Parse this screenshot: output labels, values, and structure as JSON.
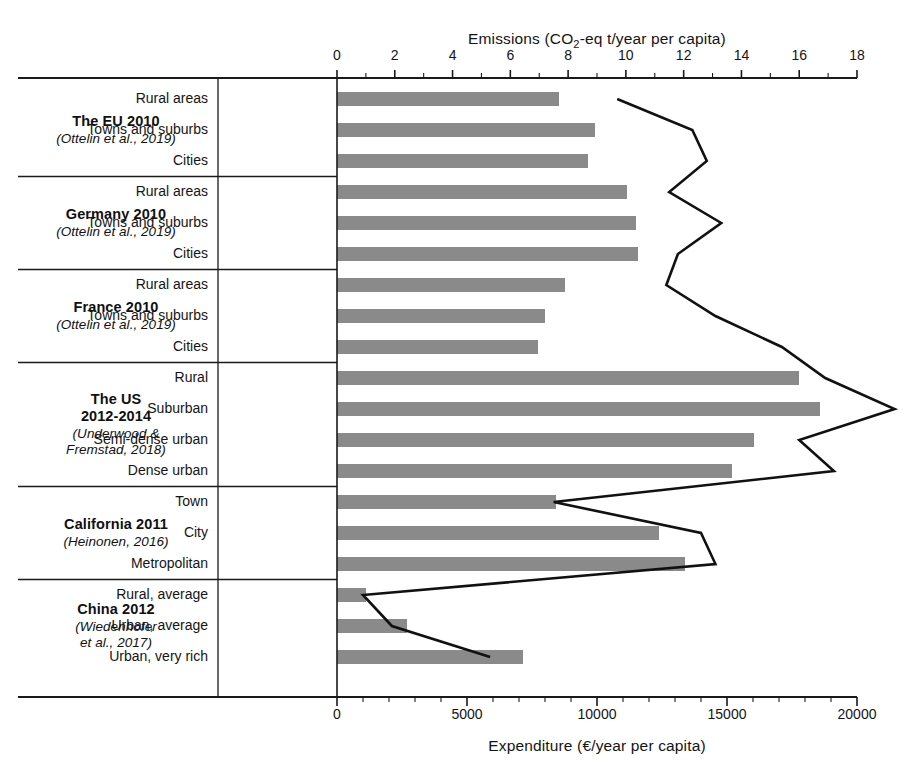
{
  "chart_data": {
    "type": "bar",
    "title": "",
    "orientation": "horizontal",
    "grid": false,
    "legend": null,
    "top_axis": {
      "label_prefix": "Emissions (CO",
      "label_sub": "2",
      "label_suffix": "-eq t/year per capita)",
      "label_full": "Emissions (CO2-eq t/year per capita)",
      "ticks": [
        0,
        2,
        4,
        6,
        8,
        10,
        12,
        14,
        16,
        18
      ],
      "range": [
        0,
        18
      ],
      "minor_tick_step": 1
    },
    "bottom_axis": {
      "label_full": "Expenditure (€/year per capita)",
      "ticks": [
        "0",
        "5000",
        "10000",
        "15000",
        "20000"
      ],
      "tick_values": [
        0,
        5000,
        10000,
        15000,
        20000
      ],
      "range": [
        0,
        20000
      ],
      "minor_tick_step": 1000
    },
    "series": [
      {
        "name": "Expenditure",
        "render": "bar",
        "axis": "bottom",
        "color": "#8a8a8a",
        "values": [
          8540,
          9940,
          9670,
          11150,
          11500,
          11580,
          8770,
          7990,
          7720,
          17780,
          18560,
          16020,
          15200,
          8430,
          12400,
          13370,
          1100,
          2700,
          7150
        ]
      },
      {
        "name": "Emissions",
        "render": "line",
        "axis": "top",
        "color": "#111111",
        "values": [
          9.7,
          12.3,
          12.8,
          11.5,
          13.3,
          11.8,
          11.4,
          13.1,
          15.4,
          16.9,
          19.3,
          16.0,
          17.2,
          7.5,
          12.6,
          13.1,
          0.9,
          1.9,
          5.3
        ]
      }
    ],
    "groups": [
      {
        "title": "The EU 2010",
        "citation": "(Ottelin et al., 2019)",
        "categories": [
          "Rural areas",
          "Towns and suburbs",
          "Cities"
        ]
      },
      {
        "title": "Germany 2010",
        "citation": "(Ottelin et al., 2019)",
        "categories": [
          "Rural areas",
          "Towns and suburbs",
          "Cities"
        ]
      },
      {
        "title": "France 2010",
        "citation": "(Ottelin et al., 2019)",
        "categories": [
          "Rural areas",
          "Towns and suburbs",
          "Cities"
        ]
      },
      {
        "title": "The US\n2012-2014",
        "title_line1": "The US",
        "title_line2": "2012-2014",
        "citation": "(Underwood &\nFremstad, 2018)",
        "citation_line1": "(Underwood &",
        "citation_line2": "Fremstad, 2018)",
        "categories": [
          "Rural",
          "Suburban",
          "Semi-dense urban",
          "Dense urban"
        ]
      },
      {
        "title": "California 2011",
        "citation": "(Heinonen, 2016)",
        "categories": [
          "Town",
          "City",
          "Metropolitan"
        ]
      },
      {
        "title": "China 2012",
        "citation": "(Wiedenhofer\net al., 2017)",
        "citation_line1": "(Wiedenhofer",
        "citation_line2": "et al., 2017)",
        "categories": [
          "Rural, average",
          "Urban, average",
          "Urban, very rich"
        ]
      }
    ],
    "rows": [
      {
        "group": "The EU 2010",
        "category": "Rural areas",
        "expenditure": 8540,
        "emissions": 9.7
      },
      {
        "group": "The EU 2010",
        "category": "Towns and suburbs",
        "expenditure": 9940,
        "emissions": 12.3
      },
      {
        "group": "The EU 2010",
        "category": "Cities",
        "expenditure": 9670,
        "emissions": 12.8
      },
      {
        "group": "Germany 2010",
        "category": "Rural areas",
        "expenditure": 11150,
        "emissions": 11.5
      },
      {
        "group": "Germany 2010",
        "category": "Towns and suburbs",
        "expenditure": 11500,
        "emissions": 13.3
      },
      {
        "group": "Germany 2010",
        "category": "Cities",
        "expenditure": 11580,
        "emissions": 11.8
      },
      {
        "group": "France 2010",
        "category": "Rural areas",
        "expenditure": 8770,
        "emissions": 11.4
      },
      {
        "group": "France 2010",
        "category": "Towns and suburbs",
        "expenditure": 7990,
        "emissions": 13.1
      },
      {
        "group": "France 2010",
        "category": "Cities",
        "expenditure": 7720,
        "emissions": 15.4
      },
      {
        "group": "The US 2012-2014",
        "category": "Rural",
        "expenditure": 17780,
        "emissions": 16.9
      },
      {
        "group": "The US 2012-2014",
        "category": "Suburban",
        "expenditure": 18560,
        "emissions": 19.3
      },
      {
        "group": "The US 2012-2014",
        "category": "Semi-dense urban",
        "expenditure": 16020,
        "emissions": 16.0
      },
      {
        "group": "The US 2012-2014",
        "category": "Dense urban",
        "expenditure": 15200,
        "emissions": 17.2
      },
      {
        "group": "California 2011",
        "category": "Town",
        "expenditure": 8430,
        "emissions": 7.5
      },
      {
        "group": "California 2011",
        "category": "City",
        "expenditure": 12400,
        "emissions": 12.6
      },
      {
        "group": "California 2011",
        "category": "Metropolitan",
        "expenditure": 13370,
        "emissions": 13.1
      },
      {
        "group": "China 2012",
        "category": "Rural, average",
        "expenditure": 1100,
        "emissions": 0.9
      },
      {
        "group": "China 2012",
        "category": "Urban, average",
        "expenditure": 2700,
        "emissions": 1.9
      },
      {
        "group": "China 2012",
        "category": "Urban, very rich",
        "expenditure": 7150,
        "emissions": 5.3
      }
    ],
    "colors": {
      "bar": "#8a8a8a",
      "line": "#111111",
      "axis": "#1a1a1a",
      "background": "#ffffff"
    }
  }
}
